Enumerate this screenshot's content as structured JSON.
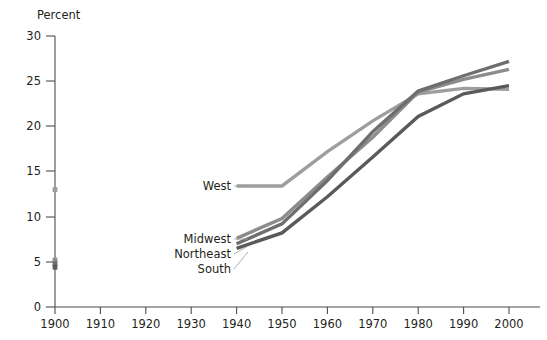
{
  "chart_data": {
    "type": "line",
    "title": "",
    "ylabel": "Percent",
    "xlabel": "",
    "xlim": [
      1900,
      2000
    ],
    "ylim": [
      0,
      30
    ],
    "grid": false,
    "legend_position": "inline-labels",
    "x_ticks": [
      "1900",
      "1910",
      "1920",
      "1930",
      "1940",
      "1950",
      "1960",
      "1970",
      "1980",
      "1990",
      "2000"
    ],
    "y_ticks": [
      "0",
      "5",
      "10",
      "15",
      "20",
      "25",
      "30"
    ],
    "x": [
      1900,
      1940,
      1950,
      1960,
      1970,
      1980,
      1990,
      2000
    ],
    "series": [
      {
        "name": "West",
        "color": "#9e9e9e",
        "marker_1900": 13.0,
        "values": [
          13.0,
          13.4,
          13.4,
          17.2,
          20.6,
          23.6,
          24.2,
          24.1
        ]
      },
      {
        "name": "Midwest",
        "color": "#8c8c8c",
        "marker_1900": 5.2,
        "values": [
          5.2,
          7.6,
          9.8,
          14.4,
          18.8,
          23.8,
          25.2,
          26.3
        ]
      },
      {
        "name": "Northeast",
        "color": "#6e6e6e",
        "marker_1900": 4.8,
        "values": [
          4.8,
          7.0,
          9.2,
          14.0,
          19.4,
          23.9,
          25.6,
          27.2
        ]
      },
      {
        "name": "South",
        "color": "#5a5a5a",
        "marker_1900": 4.4,
        "values": [
          4.4,
          6.5,
          8.2,
          12.2,
          16.6,
          21.1,
          23.6,
          24.5
        ]
      }
    ]
  },
  "labels": {
    "west": "West",
    "midwest": "Midwest",
    "northeast": "Northeast",
    "south": "South"
  },
  "axis": {
    "y_title": "Percent"
  }
}
